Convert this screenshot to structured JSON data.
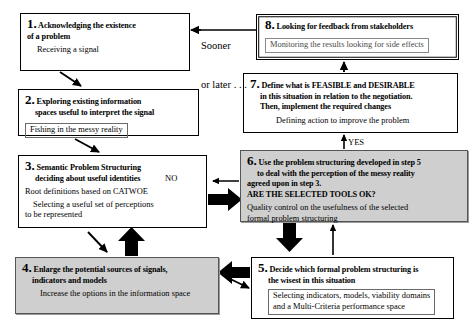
{
  "diagram": {
    "background": "#ffffff",
    "shade_color": "#cfcfcf",
    "line_color": "#000000"
  },
  "boxes": {
    "b1": {
      "number": "1.",
      "heading_line1": "Acknowledging the existence",
      "heading_line2": "of a problem",
      "subtitle": "Receiving a signal"
    },
    "b2": {
      "number": "2.",
      "heading_line1": "Exploring existing information",
      "heading_line2": "spaces useful to interpret the signal",
      "subtitle": "Fishing in the messy reality"
    },
    "b3": {
      "number": "3.",
      "heading_line1": "Semantic Problem Structuring",
      "heading_line2": "deciding about useful identities",
      "subtitle1": "Root definitions based on CATWOE",
      "subtitle2": "Selecting a useful set of perceptions",
      "subtitle3": "to be represented"
    },
    "b4": {
      "number": "4.",
      "heading_line1": "Enlarge the potential sources of signals,",
      "heading_line2": "indicators and models",
      "subtitle": "Increase the options in the information space"
    },
    "b5": {
      "number": "5.",
      "heading_line1": "Decide which formal  problem structuring is",
      "heading_line2": "the wisest in this situation",
      "subtitle1": "Selecting indicators, models, viability domains",
      "subtitle2": "and a Multi-Criteria performance space"
    },
    "b6": {
      "number": "6.",
      "heading_line1": "Use the problem structuring developed in step 5",
      "heading_line2": "to deal with the perception of the messy reality",
      "heading_line3": "agreed upon in  step 3.",
      "heading_line4": "ARE THE SELECTED TOOLS OK?",
      "subtitle1": "Quality control on the usefulness of the selected",
      "subtitle2": "formal problem structuring"
    },
    "b7": {
      "number": "7.",
      "heading_line1": "Define what is FEASIBLE and DESIRABLE",
      "heading_line2": "in this situation in relation to the negotiation.",
      "heading_line3": "Then, implement the required changes",
      "subtitle": "Defining action to improve the problem"
    },
    "b8": {
      "number": "8.",
      "heading_line1": "Looking for feedback from stakeholders",
      "subtitle": "Monitoring the results looking for side effects"
    }
  },
  "edge_labels": {
    "sooner_later_line1": "Sooner",
    "sooner_later_line2": "or later . . .",
    "no": "NO",
    "yes": "YES"
  }
}
